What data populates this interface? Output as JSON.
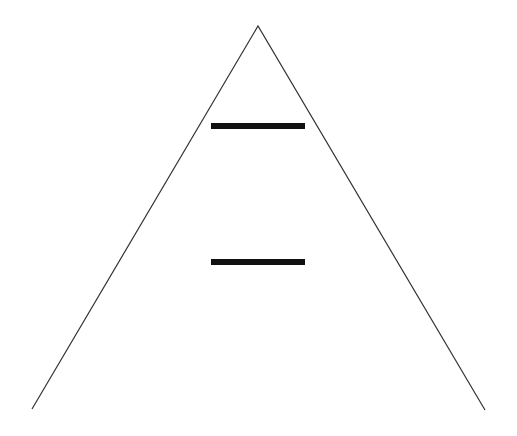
{
  "diagram": {
    "type": "triangle-with-bars",
    "background": "#ffffff",
    "triangle": {
      "apex": [
        258,
        26
      ],
      "left": [
        32,
        409
      ],
      "right": [
        485,
        410
      ],
      "stroke": "#333333",
      "stroke_width": 1.2
    },
    "bars": [
      {
        "x1": 211,
        "x2": 305,
        "y": 126,
        "thickness": 6,
        "color": "#111111"
      },
      {
        "x1": 211,
        "x2": 305,
        "y": 262,
        "thickness": 6,
        "color": "#111111"
      }
    ]
  }
}
